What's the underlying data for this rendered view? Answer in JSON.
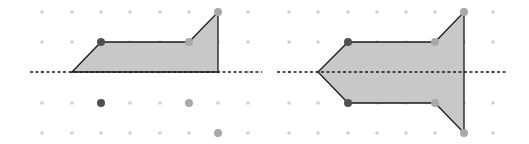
{
  "colors": {
    "background": "#ffffff",
    "grid_dot": "#d0d0d0",
    "shape_fill": "#c8c8c8",
    "shape_stroke": "#1a1a1a",
    "axis_line": "#1a1a1a",
    "point_dark": "#505050",
    "point_light": "#a8a8a8"
  },
  "grid": {
    "rows_y": [
      12,
      42,
      72,
      103,
      133
    ],
    "left_cols_x": [
      42,
      72,
      101,
      130,
      160,
      189,
      218,
      248
    ],
    "right_cols_x": [
      289,
      318,
      348,
      377,
      406,
      435,
      464,
      493
    ]
  },
  "left_panel": {
    "axis": {
      "x1": 30,
      "x2": 262,
      "y": 72
    },
    "shape": [
      [
        72,
        72
      ],
      [
        101,
        42
      ],
      [
        189,
        42
      ],
      [
        218,
        12
      ],
      [
        218,
        72
      ]
    ],
    "points": [
      {
        "x": 101,
        "y": 42,
        "tone": "dark"
      },
      {
        "x": 189,
        "y": 42,
        "tone": "light"
      },
      {
        "x": 218,
        "y": 12,
        "tone": "light"
      },
      {
        "x": 101,
        "y": 103,
        "tone": "dark"
      },
      {
        "x": 189,
        "y": 103,
        "tone": "light"
      },
      {
        "x": 218,
        "y": 133,
        "tone": "light"
      }
    ]
  },
  "right_panel": {
    "axis": {
      "x1": 277,
      "x2": 507,
      "y": 72
    },
    "shape": [
      [
        318,
        72
      ],
      [
        348,
        42
      ],
      [
        435,
        42
      ],
      [
        464,
        12
      ],
      [
        464,
        133
      ],
      [
        435,
        103
      ],
      [
        348,
        103
      ]
    ],
    "points": [
      {
        "x": 348,
        "y": 42,
        "tone": "dark"
      },
      {
        "x": 435,
        "y": 42,
        "tone": "light"
      },
      {
        "x": 464,
        "y": 12,
        "tone": "light"
      },
      {
        "x": 348,
        "y": 103,
        "tone": "dark"
      },
      {
        "x": 435,
        "y": 103,
        "tone": "light"
      },
      {
        "x": 464,
        "y": 133,
        "tone": "light"
      }
    ]
  }
}
